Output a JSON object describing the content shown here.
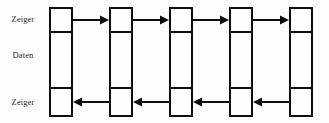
{
  "diagram": {
    "type": "doubly-linked-list",
    "canvas": {
      "width": 329,
      "height": 123,
      "background": "#fdfdfd"
    },
    "stroke_color": "#0d0d0d",
    "stroke_width": 2,
    "text_color": "#2b2b2b",
    "row_labels": [
      {
        "id": "label-pointer-next",
        "text": "Zeiger",
        "row": "top",
        "y": 15
      },
      {
        "id": "label-data",
        "text": "Daten",
        "row": "middle",
        "y": 51
      },
      {
        "id": "label-pointer-prev",
        "text": "Zeiger",
        "row": "bottom",
        "y": 98
      }
    ],
    "node_geometry": {
      "x_positions": [
        49,
        109,
        169,
        229,
        289
      ],
      "width": 24,
      "top": 7,
      "bottom": 117,
      "divider_top": 33,
      "divider_bottom": 89
    },
    "nodes": [
      {
        "id": "node-1",
        "index": 1,
        "cells": [
          "",
          "",
          ""
        ]
      },
      {
        "id": "node-2",
        "index": 2,
        "cells": [
          "",
          "",
          ""
        ]
      },
      {
        "id": "node-3",
        "index": 3,
        "cells": [
          "",
          "",
          ""
        ]
      },
      {
        "id": "node-4",
        "index": 4,
        "cells": [
          "",
          "",
          ""
        ]
      },
      {
        "id": "node-5",
        "index": 5,
        "cells": [
          "",
          "",
          ""
        ]
      }
    ],
    "arrows_forward": [
      {
        "id": "arrow-next-1-2",
        "from": 1,
        "to": 2,
        "direction": "right",
        "x": 73,
        "y": 14,
        "length": 36
      },
      {
        "id": "arrow-next-2-3",
        "from": 2,
        "to": 3,
        "direction": "right",
        "x": 133,
        "y": 14,
        "length": 36
      },
      {
        "id": "arrow-next-3-4",
        "from": 3,
        "to": 4,
        "direction": "right",
        "x": 193,
        "y": 14,
        "length": 36
      },
      {
        "id": "arrow-next-4-5",
        "from": 4,
        "to": 5,
        "direction": "right",
        "x": 253,
        "y": 14,
        "length": 36
      }
    ],
    "arrows_backward": [
      {
        "id": "arrow-prev-2-1",
        "from": 2,
        "to": 1,
        "direction": "left",
        "x": 73,
        "y": 96,
        "length": 36
      },
      {
        "id": "arrow-prev-3-2",
        "from": 3,
        "to": 2,
        "direction": "left",
        "x": 133,
        "y": 96,
        "length": 36
      },
      {
        "id": "arrow-prev-4-3",
        "from": 4,
        "to": 3,
        "direction": "left",
        "x": 193,
        "y": 96,
        "length": 36
      },
      {
        "id": "arrow-prev-5-4",
        "from": 5,
        "to": 4,
        "direction": "left",
        "x": 253,
        "y": 96,
        "length": 36
      }
    ]
  }
}
